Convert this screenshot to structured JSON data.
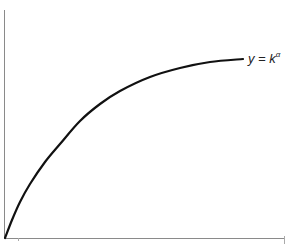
{
  "chart_data": {
    "type": "line",
    "title": "",
    "xlabel": "",
    "ylabel": "",
    "grid": false,
    "legend": null,
    "series": [
      {
        "name": "y = k^α",
        "description": "Concave increasing curve starting at origin, flattening to the right",
        "points_px": [
          [
            5,
            238
          ],
          [
            12,
            220
          ],
          [
            20,
            202
          ],
          [
            30,
            184
          ],
          [
            45,
            162
          ],
          [
            60,
            144
          ],
          [
            80,
            121
          ],
          [
            100,
            104
          ],
          [
            120,
            91
          ],
          [
            150,
            77
          ],
          [
            180,
            68
          ],
          [
            210,
            62
          ],
          [
            243,
            59
          ]
        ]
      }
    ],
    "annotations": [
      {
        "text_base": "y = k",
        "text_sup": "α",
        "x_px": 248,
        "y_px": 52
      }
    ]
  },
  "colors": {
    "curve": "#111111",
    "axis": "#8a8a8a",
    "label": "#222222"
  },
  "label": {
    "base": "y = k",
    "sup": "α"
  }
}
